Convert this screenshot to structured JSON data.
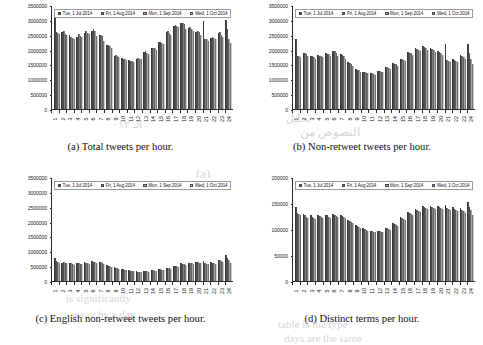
{
  "figure": {
    "legend": [
      {
        "label": "Tue, 1 Jul 2014",
        "color": "#4a4a4a"
      },
      {
        "label": "Fri, 1 Aug 2014",
        "color": "#7d7d7d"
      },
      {
        "label": "Mon, 1 Sep 2014",
        "color": "#a6a6a6"
      },
      {
        "label": "Wed, 1 Oct 2014",
        "color": "#cdcdcd"
      }
    ],
    "hours": [
      "1",
      "2",
      "3",
      "4",
      "5",
      "6",
      "7",
      "8",
      "9",
      "10",
      "11",
      "12",
      "13",
      "14",
      "15",
      "16",
      "17",
      "18",
      "19",
      "20",
      "21",
      "22",
      "23",
      "24"
    ]
  },
  "ghost_text": [
    {
      "text": "الـ ٠١٢",
      "x": 112,
      "y": 118,
      "size": 11,
      "rotate": 0
    },
    {
      "text": "تحليل",
      "x": 286,
      "y": 112,
      "size": 11,
      "rotate": 0
    },
    {
      "text": "النصوص من",
      "x": 300,
      "y": 125,
      "size": 12,
      "rotate": 0
    },
    {
      "text": "(a)",
      "x": 196,
      "y": 166,
      "size": 13,
      "rotate": 0
    },
    {
      "text": "the data set is",
      "x": 150,
      "y": 186,
      "size": 11,
      "rotate": 0
    },
    {
      "text": "analysis of",
      "x": 120,
      "y": 206,
      "size": 12,
      "rotate": 0
    },
    {
      "text": "various different",
      "x": 95,
      "y": 224,
      "size": 11,
      "rotate": 0
    },
    {
      "text": "number of terms",
      "x": 78,
      "y": 242,
      "size": 11,
      "rotate": 0
    },
    {
      "text": "the corpus and",
      "x": 108,
      "y": 258,
      "size": 11,
      "rotate": 0
    },
    {
      "text": "is significantly",
      "x": 66,
      "y": 292,
      "size": 11,
      "rotate": 0
    },
    {
      "text": "away by a day",
      "x": 72,
      "y": 308,
      "size": 11,
      "rotate": 0
    },
    {
      "text": "the set of hours",
      "x": 300,
      "y": 184,
      "size": 11,
      "rotate": 0
    },
    {
      "text": "distribution of",
      "x": 318,
      "y": 200,
      "size": 11,
      "rotate": 0
    },
    {
      "text": "table is the type",
      "x": 278,
      "y": 318,
      "size": 11,
      "rotate": 0
    },
    {
      "text": "days are the same",
      "x": 284,
      "y": 332,
      "size": 11,
      "rotate": 0
    }
  ],
  "chart_data": [
    {
      "type": "bar",
      "panel": "a",
      "caption": "(a) Total tweets per hour.",
      "title": "Total tweets per hour",
      "xlabel": "",
      "ylabel": "",
      "ylim": [
        0,
        3500000
      ],
      "ytick_labels": [
        "3500000",
        "3000000",
        "2500000",
        "2000000",
        "1500000",
        "1000000",
        "500000",
        "0"
      ],
      "ytick_values": [
        3500000,
        3000000,
        2500000,
        2000000,
        1500000,
        1000000,
        500000,
        0
      ],
      "grid": false,
      "legend_position": "top",
      "categories": [
        "1",
        "2",
        "3",
        "4",
        "5",
        "6",
        "7",
        "8",
        "9",
        "10",
        "11",
        "12",
        "13",
        "14",
        "15",
        "16",
        "17",
        "18",
        "19",
        "20",
        "21",
        "22",
        "23",
        "24"
      ],
      "series": [
        {
          "name": "Tue, 1 Jul 2014",
          "values": [
            3120000,
            2600000,
            2480000,
            2440000,
            2560000,
            2620000,
            2500000,
            2150000,
            1800000,
            1720000,
            1640000,
            1680000,
            1920000,
            2050000,
            2250000,
            2600000,
            2800000,
            2880000,
            2720000,
            2600000,
            2960000,
            2400000,
            2560000,
            3010000
          ]
        },
        {
          "name": "Fri, 1 Aug 2014",
          "values": [
            2600000,
            2620000,
            2440000,
            2520000,
            2620000,
            2700000,
            2480000,
            2170000,
            1830000,
            1700000,
            1620000,
            1720000,
            1940000,
            2070000,
            2270000,
            2620000,
            2840000,
            2900000,
            2760000,
            2640000,
            2360000,
            2440000,
            2600000,
            2700000
          ]
        },
        {
          "name": "Mon, 1 Sep 2014",
          "values": [
            2560000,
            2540000,
            2400000,
            2460000,
            2560000,
            2640000,
            2460000,
            2120000,
            1790000,
            1680000,
            1600000,
            1700000,
            1900000,
            2040000,
            2230000,
            2560000,
            2800000,
            2860000,
            2700000,
            2580000,
            2340000,
            2400000,
            2500000,
            2360000
          ]
        },
        {
          "name": "Wed, 1 Oct 2014",
          "values": [
            2520000,
            2480000,
            2360000,
            2420000,
            2520000,
            2460000,
            2300000,
            2060000,
            1740000,
            1660000,
            1580000,
            1680000,
            1860000,
            2000000,
            2200000,
            2500000,
            2760000,
            2700000,
            2640000,
            2500000,
            2300000,
            2340000,
            2440000,
            2220000
          ]
        }
      ]
    },
    {
      "type": "bar",
      "panel": "b",
      "caption": "(b) Non-retweet tweets per hour.",
      "title": "Non-retweet tweets per hour",
      "xlabel": "",
      "ylabel": "",
      "ylim": [
        0,
        3500000
      ],
      "ytick_labels": [
        "3500000",
        "3000000",
        "2500000",
        "2000000",
        "1500000",
        "1000000",
        "500000",
        "0"
      ],
      "ytick_values": [
        3500000,
        3000000,
        2500000,
        2000000,
        1500000,
        1000000,
        500000,
        0
      ],
      "grid": false,
      "legend_position": "top",
      "categories": [
        "1",
        "2",
        "3",
        "4",
        "5",
        "6",
        "7",
        "8",
        "9",
        "10",
        "11",
        "12",
        "13",
        "14",
        "15",
        "16",
        "17",
        "18",
        "19",
        "20",
        "21",
        "22",
        "23",
        "24"
      ],
      "series": [
        {
          "name": "Tue, 1 Jul 2014",
          "values": [
            2350000,
            1900000,
            1800000,
            1820000,
            1880000,
            1960000,
            1840000,
            1580000,
            1340000,
            1260000,
            1220000,
            1280000,
            1420000,
            1540000,
            1700000,
            1920000,
            2040000,
            2120000,
            2040000,
            1940000,
            2180000,
            1700000,
            1820000,
            2200000
          ]
        },
        {
          "name": "Fri, 1 Aug 2014",
          "values": [
            1800000,
            1880000,
            1780000,
            1800000,
            1860000,
            1940000,
            1820000,
            1540000,
            1320000,
            1240000,
            1200000,
            1280000,
            1400000,
            1520000,
            1680000,
            1900000,
            2020000,
            2100000,
            2020000,
            1920000,
            1660000,
            1640000,
            1800000,
            1900000
          ]
        },
        {
          "name": "Mon, 1 Sep 2014",
          "values": [
            1790000,
            1840000,
            1740000,
            1780000,
            1840000,
            1900000,
            1790000,
            1520000,
            1300000,
            1220000,
            1180000,
            1260000,
            1380000,
            1500000,
            1660000,
            1880000,
            1980000,
            2060000,
            1980000,
            1880000,
            1620000,
            1620000,
            1760000,
            1700000
          ]
        },
        {
          "name": "Wed, 1 Oct 2014",
          "values": [
            1760000,
            1800000,
            1700000,
            1740000,
            1800000,
            1800000,
            1700000,
            1460000,
            1260000,
            1200000,
            1160000,
            1240000,
            1340000,
            1460000,
            1620000,
            1820000,
            1940000,
            1980000,
            1920000,
            1820000,
            1580000,
            1580000,
            1700000,
            1500000
          ]
        }
      ]
    },
    {
      "type": "bar",
      "panel": "c",
      "caption": "(c) English non-retweet tweets per hour.",
      "title": "English non-retweet tweets per hour",
      "xlabel": "",
      "ylabel": "",
      "ylim": [
        0,
        3500000
      ],
      "ytick_labels": [
        "3500000",
        "3000000",
        "2500000",
        "2000000",
        "1500000",
        "1000000",
        "500000",
        "0"
      ],
      "ytick_values": [
        3500000,
        3000000,
        2500000,
        2000000,
        1500000,
        1000000,
        500000,
        0
      ],
      "grid": false,
      "legend_position": "top",
      "categories": [
        "1",
        "2",
        "3",
        "4",
        "5",
        "6",
        "7",
        "8",
        "9",
        "10",
        "11",
        "12",
        "13",
        "14",
        "15",
        "16",
        "17",
        "18",
        "19",
        "20",
        "21",
        "22",
        "23",
        "24"
      ],
      "series": [
        {
          "name": "Tue, 1 Jul 2014",
          "values": [
            760000,
            620000,
            600000,
            610000,
            630000,
            660000,
            640000,
            540000,
            470000,
            400000,
            360000,
            330000,
            340000,
            370000,
            400000,
            450000,
            520000,
            590000,
            620000,
            640000,
            690000,
            640000,
            720000,
            880000
          ]
        },
        {
          "name": "Fri, 1 Aug 2014",
          "values": [
            660000,
            640000,
            590000,
            600000,
            620000,
            650000,
            630000,
            520000,
            450000,
            390000,
            350000,
            320000,
            340000,
            360000,
            400000,
            440000,
            510000,
            580000,
            610000,
            630000,
            600000,
            620000,
            700000,
            760000
          ]
        },
        {
          "name": "Mon, 1 Sep 2014",
          "values": [
            640000,
            610000,
            570000,
            580000,
            600000,
            630000,
            610000,
            500000,
            430000,
            370000,
            340000,
            310000,
            330000,
            350000,
            380000,
            430000,
            490000,
            560000,
            590000,
            610000,
            580000,
            600000,
            670000,
            700000
          ]
        },
        {
          "name": "Wed, 1 Oct 2014",
          "values": [
            620000,
            590000,
            550000,
            560000,
            580000,
            600000,
            580000,
            470000,
            410000,
            360000,
            330000,
            300000,
            320000,
            340000,
            370000,
            420000,
            470000,
            540000,
            570000,
            590000,
            560000,
            580000,
            640000,
            620000
          ]
        }
      ]
    },
    {
      "type": "bar",
      "panel": "d",
      "caption": "(d) Distinct terms per hour.",
      "title": "Distinct terms per hour",
      "xlabel": "",
      "ylabel": "",
      "ylim": [
        0,
        200000
      ],
      "ytick_labels": [
        "200000",
        "150000",
        "100000",
        "50000",
        "0"
      ],
      "ytick_values": [
        200000,
        150000,
        100000,
        50000,
        0
      ],
      "grid": false,
      "legend_position": "top",
      "categories": [
        "1",
        "2",
        "3",
        "4",
        "5",
        "6",
        "7",
        "8",
        "9",
        "10",
        "11",
        "12",
        "13",
        "14",
        "15",
        "16",
        "17",
        "18",
        "19",
        "20",
        "21",
        "22",
        "23",
        "24"
      ],
      "series": [
        {
          "name": "Tue, 1 Jul 2014",
          "values": [
            142000,
            128000,
            126000,
            126000,
            127000,
            128000,
            126000,
            118000,
            107000,
            101000,
            97000,
            97000,
            102000,
            112000,
            124000,
            133000,
            139000,
            144000,
            145000,
            144000,
            146000,
            142000,
            140000,
            151000
          ]
        },
        {
          "name": "Fri, 1 Aug 2014",
          "values": [
            130000,
            126000,
            124000,
            125000,
            126000,
            127000,
            125000,
            116000,
            105000,
            100000,
            96000,
            96000,
            101000,
            110000,
            122000,
            131000,
            137000,
            142000,
            143000,
            142000,
            140000,
            139000,
            137000,
            142000
          ]
        },
        {
          "name": "Mon, 1 Sep 2014",
          "values": [
            128000,
            124000,
            122000,
            123000,
            124000,
            125000,
            123000,
            114000,
            103000,
            98000,
            95000,
            95000,
            100000,
            108000,
            120000,
            129000,
            135000,
            140000,
            141000,
            140000,
            138000,
            136000,
            134000,
            136000
          ]
        },
        {
          "name": "Wed, 1 Oct 2014",
          "values": [
            126000,
            122000,
            120000,
            121000,
            122000,
            123000,
            121000,
            112000,
            101000,
            97000,
            94000,
            94000,
            98000,
            106000,
            118000,
            127000,
            133000,
            138000,
            139000,
            138000,
            136000,
            134000,
            130000,
            127000
          ]
        }
      ]
    }
  ]
}
